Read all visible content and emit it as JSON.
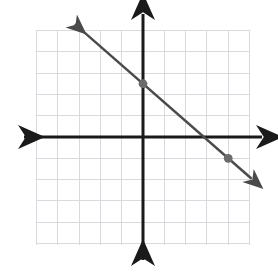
{
  "figure": {
    "title": "",
    "background_color": "#ffffff"
  },
  "chart_data": {
    "type": "line",
    "title": "",
    "xlabel": "",
    "ylabel": "",
    "xlim": [
      -5,
      5
    ],
    "ylim": [
      -5,
      5
    ],
    "grid": true,
    "grid_step": 1,
    "legend": "none",
    "axes": {
      "x_axis_label": "",
      "y_axis_label": "",
      "x_arrows": "both",
      "y_arrows": "both",
      "tick_labels": []
    },
    "series": [
      {
        "name": "line",
        "type": "line",
        "equation": "y = -0.875x + 2.5",
        "slope": -0.875,
        "y_intercept": 2.5,
        "x_intercept": 2.857,
        "endpoints": [
          {
            "x": -3.2,
            "y": 5.3
          },
          {
            "x": 5.1,
            "y": -1.96
          }
        ],
        "color": "#4a4a4a",
        "arrows": "both"
      }
    ],
    "points": [
      {
        "name": "point-y-intercept",
        "x": 0,
        "y": 2.5,
        "color": "#6b6b6b",
        "label": ""
      },
      {
        "name": "point-second",
        "x": 4,
        "y": -1,
        "color": "#6b6b6b",
        "label": ""
      }
    ],
    "colors": {
      "grid": "#d9d9e0",
      "axis": "#1a1a1a",
      "line": "#4a4a4a",
      "point": "#666666",
      "background": "#ffffff"
    }
  }
}
